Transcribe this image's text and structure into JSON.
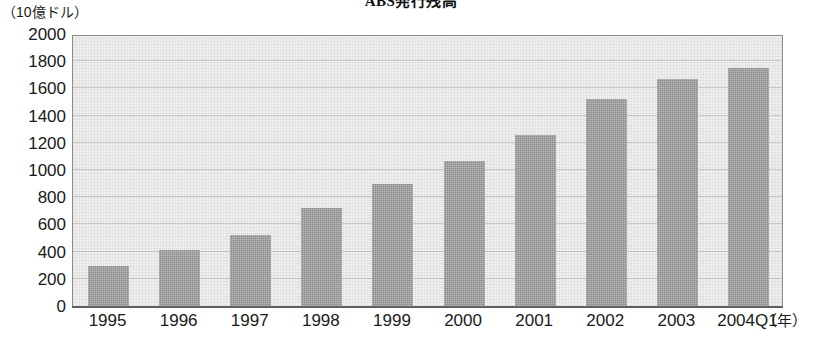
{
  "chart_data": {
    "type": "bar",
    "title": "ABS発行残高",
    "xlabel": "（年）",
    "ylabel": "（10億ドル）",
    "categories": [
      "1995",
      "1996",
      "1997",
      "1998",
      "1999",
      "2000",
      "2001",
      "2002",
      "2003",
      "2004Q1"
    ],
    "values": [
      295,
      415,
      525,
      720,
      900,
      1065,
      1260,
      1525,
      1670,
      1750
    ],
    "ylim": [
      0,
      2000
    ],
    "y_ticks": [
      "0",
      "200",
      "400",
      "600",
      "800",
      "1000",
      "1200",
      "1400",
      "1600",
      "1800",
      "2000"
    ],
    "y_tick_values": [
      0,
      200,
      400,
      600,
      800,
      1000,
      1200,
      1400,
      1600,
      1800,
      2000
    ],
    "grid": true,
    "legend": "none",
    "series": [
      {
        "name": "ABS発行残高",
        "values": [
          295,
          415,
          525,
          720,
          900,
          1065,
          1260,
          1525,
          1670,
          1750
        ]
      }
    ],
    "colors": {
      "bar": "#8c8c8c",
      "plot_background": "#eeeeee",
      "axis": "#5f5f5f",
      "text": "#1a1a1a"
    }
  }
}
